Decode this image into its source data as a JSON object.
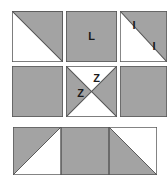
{
  "figure": {
    "background_color": "#ffffff",
    "fill_gray": "#a3a3a3",
    "fill_white": "#ffffff",
    "stroke_color": "#555555",
    "label_color": "#1a1a1a",
    "grid": {
      "rows": 3,
      "columns": 3
    }
  },
  "cells": [
    {
      "id": "cell-r1c1",
      "row": 1,
      "column": 1,
      "pattern": "half-square-triangle",
      "diagonal": "top-left-to-bottom-right",
      "fill_upper_right": "#a3a3a3",
      "fill_lower_left": "#ffffff",
      "labels": []
    },
    {
      "id": "cell-r1c2",
      "row": 1,
      "column": 2,
      "pattern": "solid",
      "fill": "#a3a3a3",
      "labels": [
        {
          "text": "L",
          "region": "center",
          "x": 50,
          "y": 50
        }
      ]
    },
    {
      "id": "cell-r1c3",
      "row": 1,
      "column": 3,
      "pattern": "half-square-triangle",
      "diagonal": "top-left-to-bottom-right",
      "fill_upper_left": "#ffffff",
      "fill_lower_right": "#a3a3a3",
      "labels": [
        {
          "text": "I",
          "region": "upper-left-white",
          "x": 31,
          "y": 29
        },
        {
          "text": "I",
          "region": "lower-right-gray",
          "x": 72,
          "y": 70
        }
      ]
    },
    {
      "id": "cell-r2c1",
      "row": 2,
      "column": 1,
      "pattern": "solid",
      "fill": "#a3a3a3",
      "labels": []
    },
    {
      "id": "cell-r2c2",
      "row": 2,
      "column": 2,
      "pattern": "hourglass-bowtie",
      "fill_left": "#a3a3a3",
      "fill_right": "#a3a3a3",
      "fill_top": "#ffffff",
      "fill_bottom": "#ffffff",
      "labels": [
        {
          "text": "Z",
          "region": "top-white",
          "x": 58,
          "y": 23
        },
        {
          "text": "Z",
          "region": "left-gray",
          "x": 27,
          "y": 52
        }
      ]
    },
    {
      "id": "cell-r2c3",
      "row": 2,
      "column": 3,
      "pattern": "solid",
      "fill": "#a3a3a3",
      "labels": []
    },
    {
      "id": "cell-r3c1",
      "row": 3,
      "column": 1,
      "pattern": "half-square-triangle",
      "diagonal": "bottom-left-to-top-right",
      "fill_upper_left": "#a3a3a3",
      "fill_lower_right": "#ffffff",
      "labels": []
    },
    {
      "id": "cell-r3c2",
      "row": 3,
      "column": 2,
      "pattern": "solid",
      "fill": "#a3a3a3",
      "labels": []
    },
    {
      "id": "cell-r3c3",
      "row": 3,
      "column": 3,
      "pattern": "half-square-triangle",
      "diagonal": "top-left-to-bottom-right",
      "fill_lower_left": "#a3a3a3",
      "fill_upper_right": "#ffffff",
      "labels": []
    }
  ],
  "label_texts": {
    "l": "L",
    "i_upper": "I",
    "i_lower": "I",
    "z_top": "Z",
    "z_left": "Z"
  }
}
